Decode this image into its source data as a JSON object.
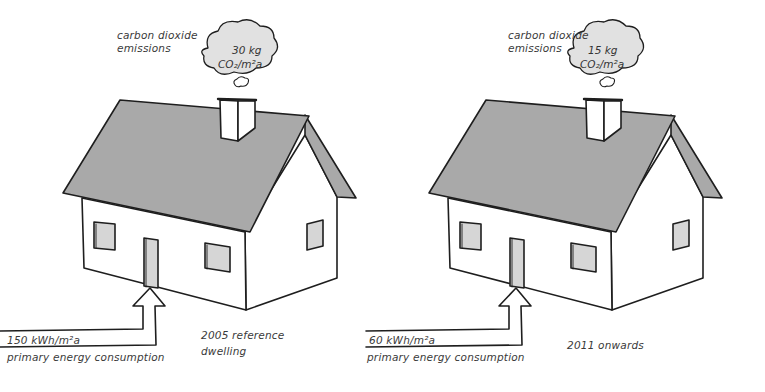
{
  "colors": {
    "roof": "#a9a9a9",
    "window": "#d6d6d6",
    "stroke": "#1e1e1e",
    "text": "#3a3a3a",
    "background": "#ffffff"
  },
  "houses": [
    {
      "id": "reference-2005",
      "emissions_label_line1": "carbon dioxide",
      "emissions_label_line2": "emissions",
      "emissions_value": "30 kg",
      "emissions_unit": "CO₂/m²a",
      "energy_value": "150 kWh/m²a",
      "energy_label": "primary energy consumption",
      "caption_line1": "2005 reference",
      "caption_line2": "dwelling"
    },
    {
      "id": "onwards-2011",
      "emissions_label_line1": "carbon dioxide",
      "emissions_label_line2": "emissions",
      "emissions_value": "15 kg",
      "emissions_unit": "CO₂/m²a",
      "energy_value": "60 kWh/m²a",
      "energy_label": "primary energy consumption",
      "caption_line1": "2011 onwards",
      "caption_line2": ""
    }
  ]
}
